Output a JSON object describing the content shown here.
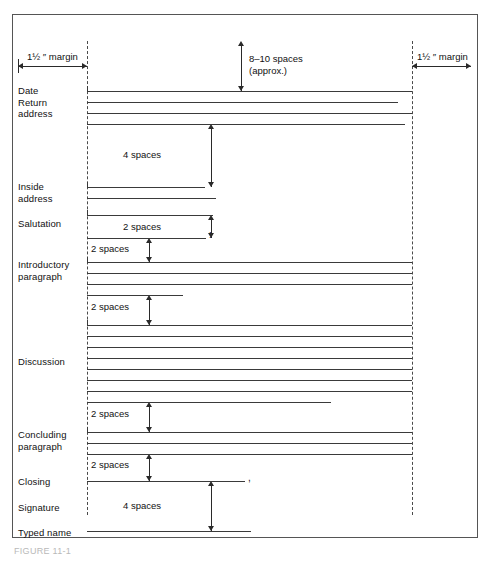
{
  "figure": {
    "caption": "FIGURE 11-1",
    "margin_label_left": "1½ ″ margin",
    "margin_label_right": "1½ ″ margin"
  },
  "annotations": {
    "top_spacing": {
      "line1": "8–10 spaces",
      "line2": "(approx.)"
    },
    "date_to_inside": "4 spaces",
    "inside_to_salutation": "2 spaces",
    "salutation_to_body": "2 spaces",
    "intro_to_discussion": "2 spaces",
    "discussion_to_concluding": "2 spaces",
    "concluding_to_closing": "2 spaces",
    "closing_to_typed_name": "4 spaces"
  },
  "punctuation": {
    "salutation_colon": ":",
    "closing_comma": ","
  },
  "sections": [
    {
      "id": "date-return-address",
      "label": "Date\nReturn\naddress"
    },
    {
      "id": "inside-address",
      "label": "Inside\naddress"
    },
    {
      "id": "salutation",
      "label": "Salutation"
    },
    {
      "id": "introductory-paragraph",
      "label": "Introductory\nparagraph"
    },
    {
      "id": "discussion",
      "label": "Discussion"
    },
    {
      "id": "concluding-paragraph",
      "label": "Concluding\nparagraph"
    },
    {
      "id": "closing",
      "label": "Closing"
    },
    {
      "id": "signature",
      "label": "Signature"
    },
    {
      "id": "typed-name",
      "label": "Typed name"
    }
  ],
  "colors": {
    "frame": "#555555",
    "rule": "#3a3a3a",
    "guide": "#4a4a4a",
    "text": "#111111"
  },
  "layout": {
    "left_margin_x": 74,
    "right_margin_x": 399,
    "text_lines": [
      {
        "group": "date-return-address",
        "y": 76,
        "x1": 74,
        "x2": 399,
        "cap": true
      },
      {
        "group": "date-return-address",
        "y": 87,
        "x1": 74,
        "x2": 385
      },
      {
        "group": "date-return-address",
        "y": 98,
        "x1": 74,
        "x2": 399
      },
      {
        "group": "date-return-address",
        "y": 109,
        "x1": 74,
        "x2": 392
      },
      {
        "group": "inside-address",
        "y": 172,
        "x1": 74,
        "x2": 192,
        "cap": true
      },
      {
        "group": "inside-address",
        "y": 183,
        "x1": 74,
        "x2": 203
      },
      {
        "group": "salutation",
        "y": 200,
        "x1": 74,
        "x2": 200,
        "cap": true
      },
      {
        "group": "salutation",
        "y": 223,
        "x1": 74,
        "x2": 193,
        "punct": ":"
      },
      {
        "group": "introductory-paragraph",
        "y": 247,
        "x1": 74,
        "x2": 399,
        "cap": true
      },
      {
        "group": "introductory-paragraph",
        "y": 258,
        "x1": 74,
        "x2": 399
      },
      {
        "group": "introductory-paragraph",
        "y": 269,
        "x1": 74,
        "x2": 399
      },
      {
        "group": "introductory-paragraph",
        "y": 280,
        "x1": 74,
        "x2": 170
      },
      {
        "group": "discussion",
        "y": 310,
        "x1": 74,
        "x2": 399,
        "cap": true
      },
      {
        "group": "discussion",
        "y": 321,
        "x1": 74,
        "x2": 399
      },
      {
        "group": "discussion",
        "y": 332,
        "x1": 74,
        "x2": 399
      },
      {
        "group": "discussion",
        "y": 343,
        "x1": 74,
        "x2": 399
      },
      {
        "group": "discussion",
        "y": 354,
        "x1": 74,
        "x2": 399
      },
      {
        "group": "discussion",
        "y": 365,
        "x1": 74,
        "x2": 399
      },
      {
        "group": "discussion",
        "y": 376,
        "x1": 74,
        "x2": 399
      },
      {
        "group": "discussion",
        "y": 387,
        "x1": 74,
        "x2": 318
      },
      {
        "group": "concluding-paragraph",
        "y": 417,
        "x1": 74,
        "x2": 399,
        "cap": true
      },
      {
        "group": "concluding-paragraph",
        "y": 428,
        "x1": 74,
        "x2": 399
      },
      {
        "group": "concluding-paragraph",
        "y": 439,
        "x1": 74,
        "x2": 399
      },
      {
        "group": "closing",
        "y": 466,
        "x1": 74,
        "x2": 232,
        "punct": ","
      },
      {
        "group": "typed-name",
        "y": 516,
        "x1": 74,
        "x2": 238
      }
    ]
  }
}
